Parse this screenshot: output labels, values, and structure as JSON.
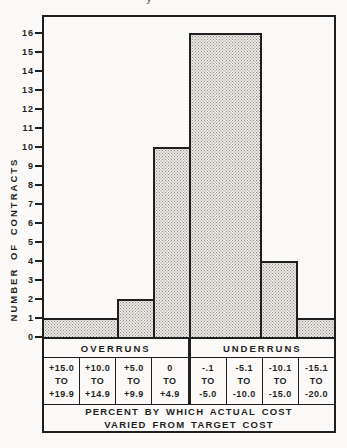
{
  "colors": {
    "ink": "#1f1f1f",
    "paper": "#fbfaf8",
    "bar_fill": "#ebe9e5",
    "bar_dots": "#8d8a84"
  },
  "figure": {
    "cropped_title_fragment": "y"
  },
  "chart_data": {
    "type": "bar",
    "title": "",
    "ylabel": "NUMBER OF CONTRACTS",
    "xlabel": "PERCENT BY WHICH ACTUAL COST VARIED FROM TARGET COST",
    "xlabel_lines": [
      "PERCENT BY WHICH ACTUAL COST",
      "VARIED FROM TARGET COST"
    ],
    "ylim": [
      0,
      17
    ],
    "y_ticks": [
      0,
      1,
      2,
      3,
      4,
      5,
      6,
      7,
      8,
      9,
      10,
      11,
      12,
      13,
      14,
      15,
      16
    ],
    "grid": false,
    "legend": null,
    "groups": [
      {
        "label": "OVERRUNS",
        "bins": [
          0,
          1,
          2,
          3
        ]
      },
      {
        "label": "UNDERRUNS",
        "bins": [
          4,
          5,
          6,
          7
        ]
      }
    ],
    "categories": [
      "+15.0 TO +19.9",
      "+10.0 TO +14.9",
      "+5.0 TO +9.9",
      "0 TO +4.9",
      "-.1 TO -5.0",
      "-5.1 TO -10.0",
      "-10.1 TO -15.0",
      "-15.1 TO -20.0"
    ],
    "values": [
      1,
      1,
      2,
      10,
      16,
      16,
      4,
      1
    ],
    "bins": [
      {
        "lines": [
          "+15.0",
          "TO",
          "+19.9"
        ],
        "value": 1
      },
      {
        "lines": [
          "+10.0",
          "TO",
          "+14.9"
        ],
        "value": 1
      },
      {
        "lines": [
          "+5.0",
          "TO",
          "+9.9"
        ],
        "value": 2
      },
      {
        "lines": [
          "0",
          "TO",
          "+4.9"
        ],
        "value": 10
      },
      {
        "lines": [
          "-.1",
          "TO",
          "-5.0"
        ],
        "value": 16
      },
      {
        "lines": [
          "-5.1",
          "TO",
          "-10.0"
        ],
        "value": 16
      },
      {
        "lines": [
          "-10.1",
          "TO",
          "-15.0"
        ],
        "value": 4
      },
      {
        "lines": [
          "-15.1",
          "TO",
          "-20.0"
        ],
        "value": 1
      }
    ]
  }
}
